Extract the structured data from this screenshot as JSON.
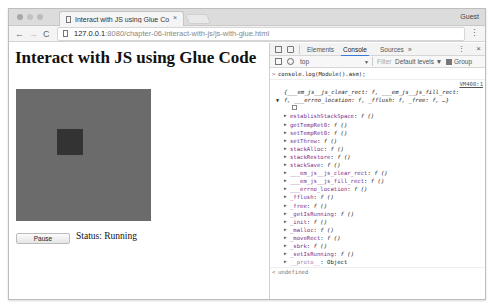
{
  "browser": {
    "tab_title": "Interact with JS using Glue Co",
    "tab_close": "×",
    "profile": "Guest",
    "url_host": "127.0.0.1",
    "url_rest": ":8080/chapter-06-interact-with-js/js-with-glue.html",
    "back": "←",
    "forward": "→",
    "reload": "C",
    "menu": "⋮"
  },
  "page": {
    "heading": "Interact with JS using Glue Code",
    "pause_label": "Pause",
    "status_text": "Status: Running",
    "canvas_color": "#6b6b6b",
    "rect_color": "#333333",
    "rect": {
      "x": 41,
      "y": 40,
      "w": 26,
      "h": 26
    }
  },
  "devtools": {
    "tabs": [
      "Elements",
      "Console",
      "Sources",
      "»"
    ],
    "active_tab": "Console",
    "kebab": "⋮",
    "close": "×",
    "context": "top",
    "context_arrow": "▼",
    "filter_placeholder": "Filter",
    "levels": "Default levels ▼",
    "group_label": "Group",
    "command": "console.log(Module().asm);",
    "source_link": "VM400:1",
    "summary_line1": "{___em_js__js_clear_rect: f, ___em_js__js_fill_rect:",
    "summary_line2": "f, ___errno_location: f, _fflush: f, _free: f, …}",
    "properties": [
      {
        "key": "establishStackSpace",
        "value": "f ()"
      },
      {
        "key": "getTempRet0",
        "value": "f ()"
      },
      {
        "key": "setTempRet0",
        "value": "f ()"
      },
      {
        "key": "setThrew",
        "value": "f ()"
      },
      {
        "key": "stackAlloc",
        "value": "f ()"
      },
      {
        "key": "stackRestore",
        "value": "f ()"
      },
      {
        "key": "stackSave",
        "value": "f ()"
      },
      {
        "key": "___em_js__js_clear_rect",
        "value": "f ()"
      },
      {
        "key": "___em_js__js_fill_rect",
        "value": "f ()"
      },
      {
        "key": "___errno_location",
        "value": "f ()"
      },
      {
        "key": "_fflush",
        "value": "f ()"
      },
      {
        "key": "_free",
        "value": "f ()"
      },
      {
        "key": "_getIsRunning",
        "value": "f ()"
      },
      {
        "key": "_init",
        "value": "f ()"
      },
      {
        "key": "_malloc",
        "value": "f ()"
      },
      {
        "key": "_moveRect",
        "value": "f ()"
      },
      {
        "key": "_sbrk",
        "value": "f ()"
      },
      {
        "key": "_setIsRunning",
        "value": "f ()"
      }
    ],
    "proto_key": "__proto__",
    "proto_value": "Object",
    "result": "undefined",
    "prompt": ">",
    "result_prompt": "<"
  }
}
